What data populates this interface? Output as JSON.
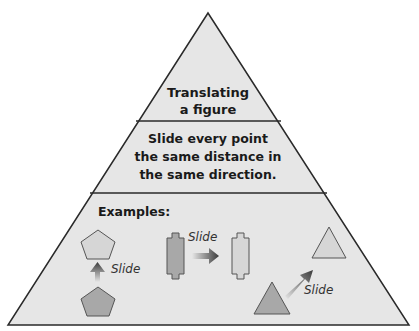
{
  "pyramid": {
    "top": {
      "lines": [
        "Translating",
        "a figure"
      ]
    },
    "middle": {
      "lines": [
        "Slide every point",
        "the same distance in",
        "the same direction."
      ]
    },
    "bottom": {
      "heading": "Examples:",
      "examples": [
        {
          "shape": "pentagon",
          "direction": "up",
          "label": "Slide"
        },
        {
          "shape": "notched-rectangle",
          "direction": "right",
          "label": "Slide"
        },
        {
          "shape": "triangle",
          "direction": "up-right",
          "label": "Slide"
        }
      ]
    }
  },
  "colors": {
    "fill": "#e6e6e6",
    "stroke": "#2a2a2a",
    "shape_original": "#a8a8a8",
    "shape_image": "#d6d6d6",
    "arrow": "#3a3a3a"
  }
}
